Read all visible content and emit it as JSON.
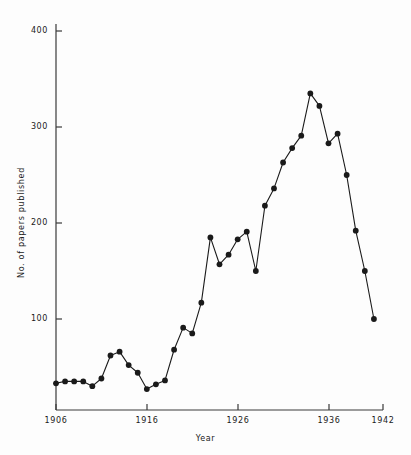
{
  "chart_data": {
    "type": "line",
    "title": "",
    "xlabel": "Year",
    "ylabel": "No. of papers published",
    "xlim": [
      1906,
      1942
    ],
    "ylim": [
      0,
      420
    ],
    "grid": false,
    "legend": null,
    "marker": "filled-circle",
    "x_ticks": [
      1906,
      1916,
      1926,
      1936,
      1942
    ],
    "x_tick_labels": [
      "1906",
      "1916",
      "1926",
      "1936",
      "1942"
    ],
    "y_ticks": [
      100,
      200,
      300,
      400
    ],
    "y_tick_labels": [
      "100",
      "200",
      "300",
      "400"
    ],
    "x": [
      1906,
      1907,
      1908,
      1909,
      1910,
      1911,
      1912,
      1913,
      1914,
      1915,
      1916,
      1917,
      1918,
      1919,
      1920,
      1921,
      1922,
      1923,
      1924,
      1925,
      1926,
      1927,
      1928,
      1929,
      1930,
      1931,
      1932,
      1933,
      1934,
      1935,
      1936,
      1937,
      1938,
      1939,
      1940,
      1941,
      1942
    ],
    "values": [
      33,
      35,
      35,
      35,
      30,
      38,
      62,
      66,
      52,
      44,
      27,
      32,
      36,
      68,
      91,
      85,
      117,
      185,
      157,
      167,
      183,
      191,
      150,
      218,
      236,
      263,
      278,
      291,
      335,
      322,
      283,
      293,
      250,
      192,
      150,
      100,
      100
    ],
    "series": [
      {
        "name": "papers published",
        "color": "#1a1a1a",
        "points": [
          {
            "year": 1906,
            "value": 33
          },
          {
            "year": 1907,
            "value": 35
          },
          {
            "year": 1908,
            "value": 35
          },
          {
            "year": 1909,
            "value": 35
          },
          {
            "year": 1910,
            "value": 30
          },
          {
            "year": 1911,
            "value": 38
          },
          {
            "year": 1912,
            "value": 62
          },
          {
            "year": 1913,
            "value": 66
          },
          {
            "year": 1914,
            "value": 52
          },
          {
            "year": 1915,
            "value": 44
          },
          {
            "year": 1916,
            "value": 27
          },
          {
            "year": 1917,
            "value": 32
          },
          {
            "year": 1918,
            "value": 36
          },
          {
            "year": 1919,
            "value": 68
          },
          {
            "year": 1920,
            "value": 91
          },
          {
            "year": 1921,
            "value": 85
          },
          {
            "year": 1922,
            "value": 117
          },
          {
            "year": 1923,
            "value": 185
          },
          {
            "year": 1924,
            "value": 157
          },
          {
            "year": 1925,
            "value": 167
          },
          {
            "year": 1926,
            "value": 183
          },
          {
            "year": 1927,
            "value": 191
          },
          {
            "year": 1928,
            "value": 150
          },
          {
            "year": 1929,
            "value": 218
          },
          {
            "year": 1930,
            "value": 236
          },
          {
            "year": 1931,
            "value": 263
          },
          {
            "year": 1932,
            "value": 278
          },
          {
            "year": 1933,
            "value": 291
          },
          {
            "year": 1934,
            "value": 335
          },
          {
            "year": 1935,
            "value": 322
          },
          {
            "year": 1936,
            "value": 283
          },
          {
            "year": 1937,
            "value": 293
          },
          {
            "year": 1938,
            "value": 250
          },
          {
            "year": 1939,
            "value": 192
          },
          {
            "year": 1940,
            "value": 150
          },
          {
            "year": 1941,
            "value": 100
          }
        ]
      }
    ]
  },
  "axes": {
    "y_title": "No. of papers published",
    "x_title": "Year",
    "y_labels": [
      "400",
      "300",
      "200",
      "100"
    ],
    "x_labels": [
      "1906",
      "1916",
      "1926",
      "1936",
      "1942"
    ],
    "axis_color": "#3a3a3a",
    "line_color": "#1a1a1a",
    "marker_color": "#111111"
  }
}
